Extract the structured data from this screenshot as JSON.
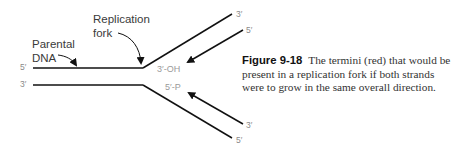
{
  "diagram": {
    "labels": {
      "replication_fork": [
        "Replication",
        "fork"
      ],
      "parental_dna": [
        "Parental",
        "DNA"
      ],
      "top_left_end": "5′",
      "bottom_left_end": "3′",
      "top_terminus": "3′-OH",
      "bottom_terminus": "5′-P",
      "upper_strand_end": "3′",
      "upper_arrow_end": "5′",
      "lower_arrow_end": "3′",
      "lower_strand_end": "5′"
    },
    "colors": {
      "strand": "#111111",
      "terminus_label": "#9a9a9a"
    }
  },
  "caption": {
    "figure_number": "Figure 9-18",
    "text": "The termini (red) that would be present in a replication fork if both strands were to grow in the same overall direction."
  }
}
